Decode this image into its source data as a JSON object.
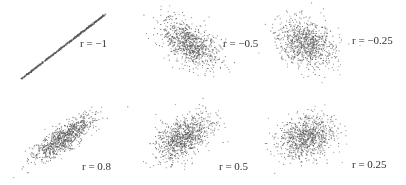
{
  "chart_data": [
    {
      "type": "scatter",
      "title": "",
      "label": "r = −1",
      "r": -1,
      "n": 600,
      "center": [
        63,
        46
      ],
      "sx": 20,
      "sy": 15,
      "label_pos": [
        80,
        38
      ]
    },
    {
      "type": "scatter",
      "title": "",
      "label": "r = −0.5",
      "r": -0.5,
      "n": 900,
      "center": [
        190,
        44
      ],
      "sx": 14,
      "sy": 12,
      "label_pos": [
        223,
        38
      ]
    },
    {
      "type": "scatter",
      "title": "",
      "label": "r = −0.25",
      "r": -0.25,
      "n": 900,
      "center": [
        306,
        43
      ],
      "sx": 14,
      "sy": 12,
      "label_pos": [
        352,
        35
      ]
    },
    {
      "type": "scatter",
      "title": "",
      "label": "r = 0.8",
      "r": 0.8,
      "n": 900,
      "center": [
        63,
        138
      ],
      "sx": 15,
      "sy": 11,
      "label_pos": [
        82,
        161
      ]
    },
    {
      "type": "scatter",
      "title": "",
      "label": "r = 0.5",
      "r": 0.5,
      "n": 900,
      "center": [
        183,
        137
      ],
      "sx": 14,
      "sy": 11,
      "label_pos": [
        219,
        161
      ]
    },
    {
      "type": "scatter",
      "title": "",
      "label": "r = 0.25",
      "r": 0.25,
      "n": 900,
      "center": [
        306,
        137
      ],
      "sx": 14,
      "sy": 11,
      "label_pos": [
        352,
        159
      ]
    }
  ],
  "panels": {
    "p0": {
      "label": "r = −1"
    },
    "p1": {
      "label": "r = −0.5"
    },
    "p2": {
      "label": "r = −0.25"
    },
    "p3": {
      "label": "r = 0.8"
    },
    "p4": {
      "label": "r = 0.5"
    },
    "p5": {
      "label": "r = 0.25"
    }
  },
  "style": {
    "point_color": "#555555",
    "background": "#ffffff"
  }
}
